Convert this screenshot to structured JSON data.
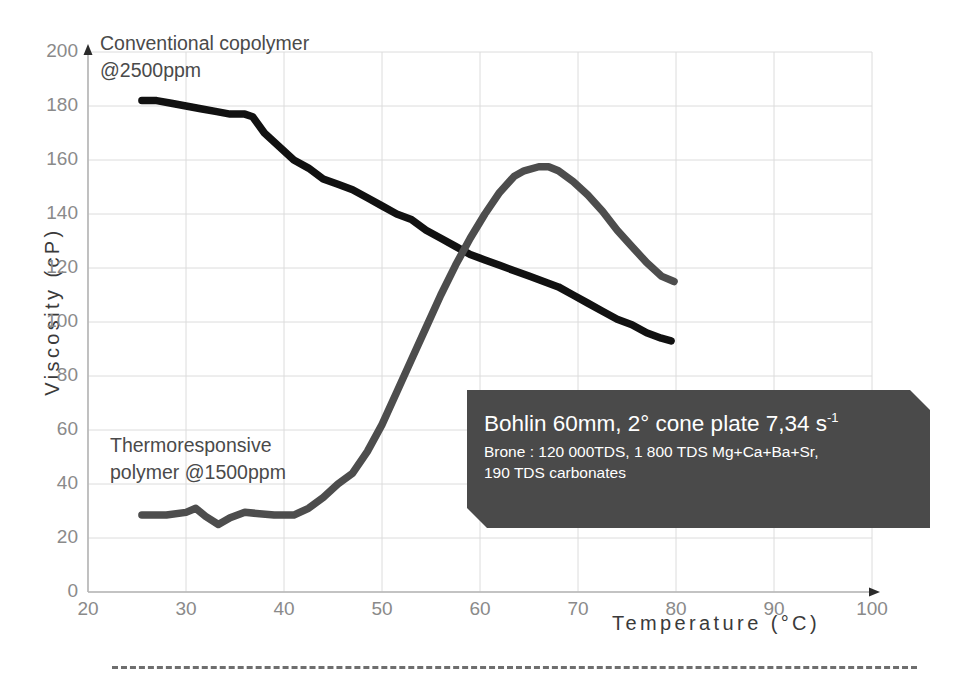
{
  "chart_data": {
    "type": "line",
    "title": "",
    "xlabel": "Temperature (°C)",
    "ylabel": "Viscosity (cP)",
    "xlim": [
      20,
      100
    ],
    "ylim": [
      0,
      200
    ],
    "xticks": [
      20,
      30,
      40,
      50,
      60,
      70,
      80,
      90,
      100
    ],
    "yticks": [
      0,
      20,
      40,
      60,
      80,
      100,
      120,
      140,
      160,
      180,
      200
    ],
    "grid": true,
    "legend_position": "inline-annotations",
    "series": [
      {
        "name": "Conventional copolymer @2500ppm",
        "color": "#111111",
        "x": [
          25.5,
          27.0,
          28.5,
          30.0,
          31.5,
          33.0,
          34.5,
          36.0,
          36.8,
          38.0,
          39.5,
          41.0,
          42.5,
          44.0,
          45.5,
          47.0,
          48.5,
          50.0,
          51.5,
          53.0,
          54.5,
          56.0,
          57.5,
          59.0,
          60.5,
          62.0,
          63.5,
          65.0,
          66.5,
          68.0,
          69.5,
          71.0,
          72.5,
          74.0,
          75.5,
          77.0,
          78.5,
          79.5
        ],
        "y": [
          182,
          182,
          181,
          180,
          179,
          178,
          177,
          177,
          176,
          170,
          165,
          160,
          157,
          153,
          151,
          149,
          146,
          143,
          140,
          138,
          134,
          131,
          128,
          125,
          123,
          121,
          119,
          117,
          115,
          113,
          110,
          107,
          104,
          101,
          99,
          96,
          94,
          93
        ]
      },
      {
        "name": "Thermoresponsive polymer @1500ppm",
        "color": "#4d4d4d",
        "x": [
          25.5,
          28.0,
          30.0,
          31.0,
          32.0,
          33.3,
          34.5,
          36.0,
          37.5,
          39.0,
          41.0,
          42.5,
          44.0,
          45.5,
          47.0,
          48.5,
          50.0,
          51.5,
          53.0,
          54.5,
          56.0,
          57.5,
          59.0,
          60.5,
          62.0,
          63.5,
          64.5,
          66.0,
          67.0,
          68.0,
          69.5,
          71.0,
          72.5,
          74.0,
          75.5,
          77.0,
          78.5,
          79.8
        ],
        "y": [
          28.5,
          28.5,
          29.5,
          31.0,
          28.0,
          25.0,
          27.5,
          29.5,
          29.0,
          28.5,
          28.5,
          31.0,
          35.0,
          40.0,
          44.0,
          52.0,
          62.0,
          74.0,
          86.0,
          98.0,
          110.0,
          121.0,
          131.0,
          140.0,
          148.0,
          154.0,
          156.0,
          157.5,
          157.5,
          156.0,
          152.0,
          147.0,
          141.0,
          134.0,
          128.0,
          122.0,
          117.0,
          115.0
        ]
      }
    ]
  },
  "axes": {
    "y_title": "Viscosity (cP)",
    "x_title": "Temperature (°C)",
    "y_ticks": [
      "0",
      "20",
      "40",
      "60",
      "80",
      "100",
      "120",
      "140",
      "160",
      "180",
      "200"
    ],
    "x_ticks": [
      "20",
      "30",
      "40",
      "50",
      "60",
      "70",
      "80",
      "90",
      "100"
    ]
  },
  "annotations": {
    "conventional_label": "Conventional copolymer\n@2500ppm",
    "thermoresponsive_label": "Thermoresponsive\npolymer @1500ppm"
  },
  "callout": {
    "title_main": "Bohlin 60mm, 2° cone plate 7,34 s",
    "title_sup": "-1",
    "subtitle": "Brone : 120 000TDS, 1 800 TDS Mg+Ca+Ba+Sr,\n190 TDS carbonates"
  },
  "colors": {
    "conventional_line": "#111111",
    "thermoresponsive_line": "#4d4d4d",
    "callout_background": "#4a4a4a",
    "grid": "#dcdcdc",
    "axis": "#b5b5b5",
    "tick_text": "#8a8a8a",
    "axis_title_text": "#3a3a3a",
    "footer_dash": "#6e6e6e"
  }
}
